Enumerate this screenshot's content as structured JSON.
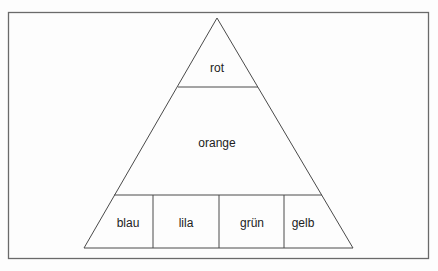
{
  "diagram": {
    "type": "pyramid",
    "levels": [
      {
        "label": "rot"
      },
      {
        "label": "orange"
      },
      {
        "label": "bottom-row",
        "cells": [
          {
            "label": "blau"
          },
          {
            "label": "lila"
          },
          {
            "label": "grün"
          },
          {
            "label": "gelb"
          }
        ]
      }
    ],
    "colors": {
      "line": "#4a4a4a",
      "frame": "#6a6a6a",
      "text": "#222222",
      "background": "#fdfdfd"
    }
  }
}
